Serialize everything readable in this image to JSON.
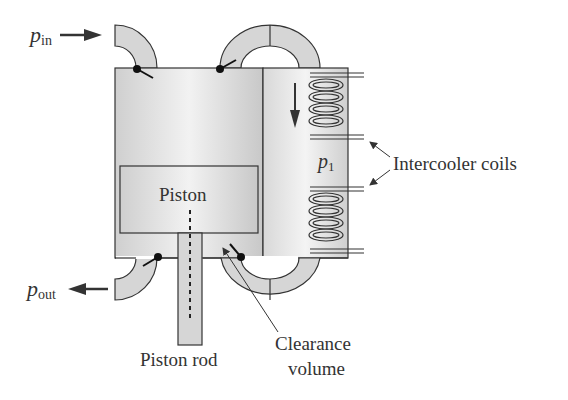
{
  "diagram": {
    "labels": {
      "p_in_main": "p",
      "p_in_sub": "in",
      "p_out_main": "p",
      "p_out_sub": "out",
      "p1_main": "p",
      "p1_sub": "1",
      "piston": "Piston",
      "piston_rod": "Piston rod",
      "clearance_line1": "Clearance",
      "clearance_line2": "volume",
      "intercooler": "Intercooler coils"
    },
    "colors": {
      "stroke": "#333333",
      "fill_light": "#d6d6d6",
      "fill_white": "#ffffff",
      "arrow": "#333333"
    }
  }
}
